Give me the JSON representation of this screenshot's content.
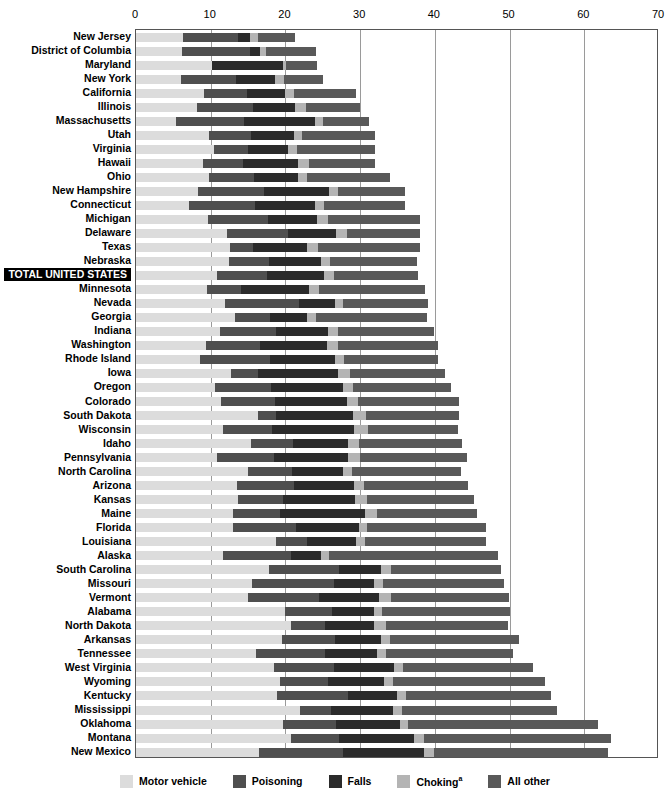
{
  "chart_data": {
    "type": "bar",
    "orientation": "horizontal",
    "stacked": true,
    "title": "",
    "subtitle": "",
    "xlabel": "",
    "ylabel": "",
    "xlim": [
      0,
      70
    ],
    "xticks": [
      0,
      10,
      20,
      30,
      40,
      50,
      60,
      70
    ],
    "grid": true,
    "legend_position": "bottom",
    "series": [
      {
        "name": "Motor vehicle",
        "color": "#dcdcdc"
      },
      {
        "name": "Poisoning",
        "color": "#4f4f4f"
      },
      {
        "name": "Falls",
        "color": "#2b2b2b"
      },
      {
        "name": "Choking",
        "color": "#b4b4b4"
      },
      {
        "name": "All other",
        "color": "#595959"
      }
    ],
    "categories": [
      "New Jersey",
      "District of Columbia",
      "Maryland",
      "New York",
      "California",
      "Illinois",
      "Massachusetts",
      "Utah",
      "Virginia",
      "Hawaii",
      "Ohio",
      "New Hampshire",
      "Connecticut",
      "Michigan",
      "Delaware",
      "Texas",
      "Nebraska",
      "TOTAL UNITED STATES",
      "Minnesota",
      "Nevada",
      "Georgia",
      "Indiana",
      "Washington",
      "Rhode Island",
      "Iowa",
      "Oregon",
      "Colorado",
      "South Dakota",
      "Wisconsin",
      "Idaho",
      "Pennsylvania",
      "North Carolina",
      "Arizona",
      "Kansas",
      "Maine",
      "Florida",
      "Louisiana",
      "Alaska",
      "South Carolina",
      "Missouri",
      "Vermont",
      "Alabama",
      "North Dakota",
      "Arkansas",
      "Tennessee",
      "West Virginia",
      "Wyoming",
      "Kentucky",
      "Mississippi",
      "Oklahoma",
      "Montana",
      "New Mexico"
    ],
    "values": [
      [
        6.3,
        7.3,
        1.6,
        1.1,
        5.0
      ],
      [
        6.1,
        9.1,
        1.4,
        0.8,
        6.7
      ],
      [
        10.2,
        0.0,
        9.5,
        0.4,
        4.1
      ],
      [
        6.0,
        7.4,
        5.2,
        1.2,
        5.2
      ],
      [
        9.1,
        5.8,
        5.0,
        1.3,
        8.3
      ],
      [
        8.2,
        7.5,
        5.6,
        1.4,
        7.3
      ],
      [
        5.4,
        9.0,
        9.6,
        1.0,
        6.2
      ],
      [
        9.8,
        5.6,
        5.8,
        1.0,
        9.8
      ],
      [
        10.4,
        4.6,
        5.4,
        1.1,
        10.5
      ],
      [
        9.0,
        5.3,
        7.4,
        1.5,
        8.8
      ],
      [
        9.8,
        6.0,
        5.9,
        1.2,
        11.1
      ],
      [
        8.3,
        8.8,
        8.8,
        1.1,
        9.0
      ],
      [
        7.1,
        8.8,
        8.1,
        1.2,
        10.8
      ],
      [
        9.7,
        8.0,
        6.5,
        1.5,
        12.3
      ],
      [
        12.2,
        8.1,
        6.5,
        1.4,
        9.8
      ],
      [
        12.6,
        3.0,
        7.3,
        1.5,
        13.6
      ],
      [
        12.4,
        5.4,
        7.0,
        1.2,
        11.6
      ],
      [
        10.9,
        6.6,
        7.6,
        1.4,
        11.2
      ],
      [
        9.5,
        4.5,
        9.2,
        1.3,
        14.2
      ],
      [
        11.9,
        9.9,
        4.9,
        1.0,
        11.4
      ],
      [
        13.3,
        4.6,
        5.0,
        1.2,
        14.9
      ],
      [
        11.2,
        7.6,
        6.9,
        1.4,
        12.8
      ],
      [
        9.4,
        7.2,
        9.0,
        1.5,
        13.3
      ],
      [
        8.5,
        9.4,
        8.8,
        1.2,
        12.5
      ],
      [
        12.7,
        3.6,
        10.7,
        1.7,
        12.7
      ],
      [
        10.6,
        7.5,
        9.6,
        1.4,
        13.0
      ],
      [
        11.4,
        7.2,
        9.6,
        1.5,
        13.5
      ],
      [
        16.3,
        2.5,
        10.3,
        1.7,
        12.4
      ],
      [
        11.6,
        6.6,
        11.0,
        1.8,
        12.1
      ],
      [
        15.4,
        5.6,
        7.4,
        1.4,
        13.9
      ],
      [
        10.8,
        7.7,
        9.9,
        1.6,
        14.3
      ],
      [
        15.0,
        5.9,
        6.8,
        1.2,
        14.6
      ],
      [
        13.5,
        7.6,
        8.1,
        1.3,
        14.0
      ],
      [
        13.7,
        6.0,
        9.6,
        1.6,
        14.3
      ],
      [
        13.0,
        6.3,
        11.4,
        1.6,
        13.4
      ],
      [
        13.0,
        8.4,
        8.5,
        1.0,
        15.9
      ],
      [
        18.7,
        4.2,
        6.6,
        1.1,
        16.2
      ],
      [
        11.7,
        9.1,
        4.0,
        1.1,
        22.6
      ],
      [
        17.8,
        9.4,
        5.6,
        1.4,
        14.6
      ],
      [
        15.5,
        11.0,
        5.3,
        1.2,
        16.2
      ],
      [
        15.0,
        9.5,
        8.0,
        1.6,
        15.8
      ],
      [
        19.9,
        6.4,
        5.5,
        1.1,
        17.1
      ],
      [
        20.8,
        4.5,
        6.5,
        1.6,
        16.4
      ],
      [
        19.6,
        7.0,
        6.2,
        1.2,
        17.3
      ],
      [
        16.0,
        9.3,
        6.9,
        1.2,
        17.1
      ],
      [
        18.5,
        8.0,
        8.0,
        1.3,
        17.4
      ],
      [
        19.3,
        6.4,
        7.5,
        1.2,
        20.3
      ],
      [
        18.9,
        9.5,
        6.6,
        1.2,
        19.3
      ],
      [
        21.9,
        4.2,
        8.3,
        1.2,
        20.7
      ],
      [
        19.7,
        7.1,
        8.5,
        1.1,
        25.5
      ],
      [
        20.8,
        6.4,
        10.0,
        1.3,
        25.1
      ],
      [
        16.5,
        11.2,
        10.8,
        1.4,
        23.3
      ]
    ]
  },
  "legend": {
    "items": [
      {
        "label": "Motor vehicle",
        "note": ""
      },
      {
        "label": "Poisoning",
        "note": ""
      },
      {
        "label": "Falls",
        "note": ""
      },
      {
        "label": "Choking",
        "note": "a"
      },
      {
        "label": "All other",
        "note": ""
      }
    ]
  }
}
